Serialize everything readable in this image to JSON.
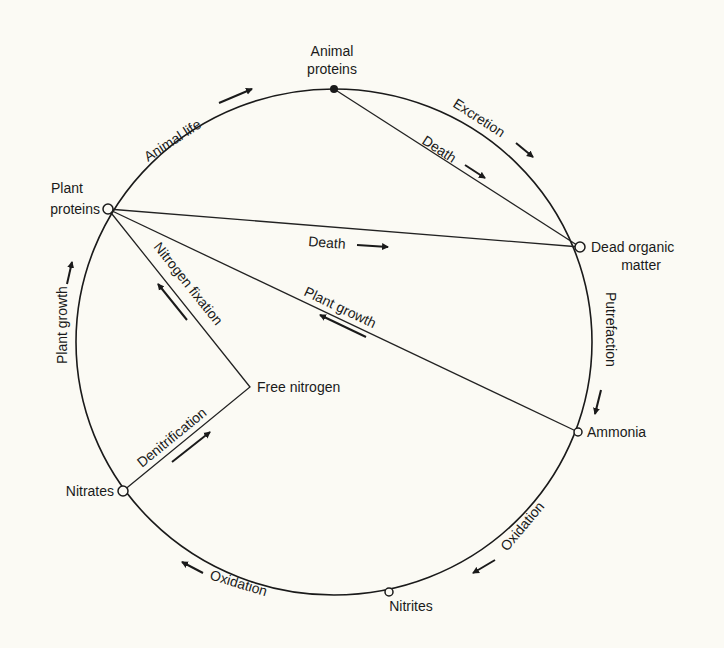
{
  "colors": {
    "background": "#fbfaf4",
    "ink": "#1a1a1a"
  },
  "nodes": {
    "animal_proteins": {
      "line1": "Animal",
      "line2": "proteins"
    },
    "plant_proteins": {
      "line1": "Plant",
      "line2": "proteins"
    },
    "dead_organic_matter": {
      "line1": "Dead organic",
      "line2": "matter"
    },
    "ammonia": {
      "label": "Ammonia"
    },
    "nitrites": {
      "label": "Nitrites"
    },
    "nitrates": {
      "label": "Nitrates"
    },
    "free_nitrogen": {
      "label": "Free nitrogen"
    }
  },
  "processes": {
    "animal_life": "Animal life",
    "excretion": "Excretion",
    "death_animal": "Death",
    "death_plant": "Death",
    "putrefaction": "Putrefaction",
    "plant_growth_chord": "Plant growth",
    "plant_growth_arc": "Plant growth",
    "nitrogen_fixation": "Nitrogen fixation",
    "denitrification": "Denitrification",
    "oxidation_ammonia_nitrites": "Oxidation",
    "oxidation_nitrites_nitrates": "Oxidation"
  },
  "edges": [
    {
      "from": "Plant proteins",
      "to": "Animal proteins",
      "process": "Animal life"
    },
    {
      "from": "Animal proteins",
      "to": "Dead organic matter",
      "process": "Excretion"
    },
    {
      "from": "Animal proteins",
      "to": "Dead organic matter",
      "process": "Death"
    },
    {
      "from": "Plant proteins",
      "to": "Dead organic matter",
      "process": "Death"
    },
    {
      "from": "Dead organic matter",
      "to": "Ammonia",
      "process": "Putrefaction"
    },
    {
      "from": "Ammonia",
      "to": "Plant proteins",
      "process": "Plant growth"
    },
    {
      "from": "Ammonia",
      "to": "Nitrites",
      "process": "Oxidation"
    },
    {
      "from": "Nitrites",
      "to": "Nitrates",
      "process": "Oxidation"
    },
    {
      "from": "Nitrates",
      "to": "Plant proteins",
      "process": "Plant growth"
    },
    {
      "from": "Nitrates",
      "to": "Free nitrogen",
      "process": "Denitrification"
    },
    {
      "from": "Free nitrogen",
      "to": "Plant proteins",
      "process": "Nitrogen fixation"
    }
  ]
}
